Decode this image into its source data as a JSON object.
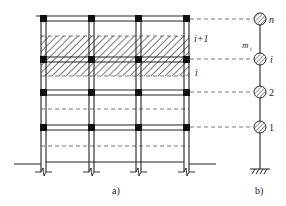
{
  "diagram": {
    "type": "frame-to-lumped-mass-model",
    "colors": {
      "line": "#222222",
      "dash": "#555555",
      "joint": "#111111",
      "hatch": "#333333",
      "background": "#ffffff"
    },
    "panel_a": {
      "label": "a)",
      "floor_labels": {
        "upper": "i+1",
        "lower": "i"
      },
      "columns": 4,
      "floors": 4
    },
    "panel_b": {
      "label": "b)",
      "mass_label": "m",
      "mass_subscript": "i",
      "nodes": [
        {
          "label": "n"
        },
        {
          "label": "i"
        },
        {
          "label": "2"
        },
        {
          "label": "1"
        }
      ]
    }
  }
}
